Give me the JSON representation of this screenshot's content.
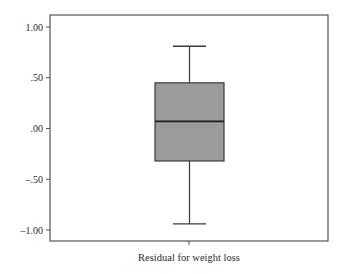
{
  "chart_data": {
    "type": "box",
    "title": "",
    "xlabel": "Residual for weight loss",
    "ylabel": "",
    "ylim": [
      -1.08,
      1.12
    ],
    "yticks": [
      1.0,
      0.5,
      0.0,
      -0.5,
      -1.0
    ],
    "ytick_labels": [
      "1.00",
      ".50",
      ".00",
      "–.50",
      "–1.00"
    ],
    "categories": [
      "Residual for weight loss"
    ],
    "grid": false,
    "legend": null,
    "boxes": [
      {
        "name": "Residual for weight loss",
        "whisker_high": 0.81,
        "q3": 0.45,
        "median": 0.07,
        "q1": -0.32,
        "whisker_low": -0.94
      }
    ]
  },
  "colors": {
    "box_fill": "#9b9b9b",
    "lines": "#3a3a3a",
    "frame": "#555555",
    "text": "#2a2a2a",
    "background": "#ffffff"
  },
  "labels": {
    "x_axis": "Residual for weight loss"
  }
}
